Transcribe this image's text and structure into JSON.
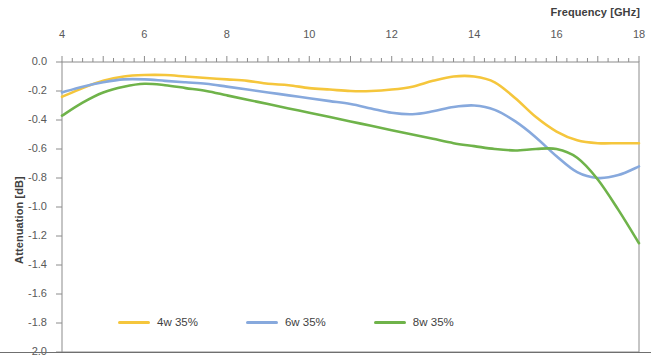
{
  "axes": {
    "x_title": "Frequency [GHz]",
    "y_title": "Attenuation [dB]",
    "x_ticks": [
      "4",
      "6",
      "8",
      "10",
      "12",
      "14",
      "16",
      "18"
    ],
    "y_ticks": [
      "0.0",
      "-0.2",
      "-0.4",
      "-0.6",
      "-0.8",
      "-1.0",
      "-1.2",
      "-1.4",
      "-1.6",
      "-1.8",
      "-2.0"
    ]
  },
  "legend": {
    "items": [
      {
        "label": "4w 35%",
        "color": "#f5c63c"
      },
      {
        "label": "6w 35%",
        "color": "#87a9dd"
      },
      {
        "label": "8w 35%",
        "color": "#6fb34a"
      }
    ]
  },
  "chart_data": {
    "type": "line",
    "title": "",
    "xlabel": "Frequency [GHz]",
    "ylabel": "Attenuation [dB]",
    "xlim": [
      4,
      18
    ],
    "ylim": [
      -2.0,
      0.0
    ],
    "x_axis_position": "top",
    "grid": false,
    "legend_position": "bottom",
    "x": [
      4,
      4.5,
      5,
      5.5,
      6,
      6.5,
      7,
      7.5,
      8,
      8.5,
      9,
      9.5,
      10,
      10.5,
      11,
      11.5,
      12,
      12.5,
      13,
      13.5,
      14,
      14.5,
      15,
      15.5,
      16,
      16.5,
      17,
      17.5,
      18
    ],
    "series": [
      {
        "name": "4w 35%",
        "color": "#f5c63c",
        "values": [
          -0.24,
          -0.18,
          -0.13,
          -0.1,
          -0.09,
          -0.09,
          -0.1,
          -0.11,
          -0.12,
          -0.13,
          -0.15,
          -0.16,
          -0.18,
          -0.19,
          -0.2,
          -0.2,
          -0.19,
          -0.17,
          -0.13,
          -0.1,
          -0.1,
          -0.14,
          -0.25,
          -0.38,
          -0.48,
          -0.54,
          -0.56,
          -0.56,
          -0.56
        ]
      },
      {
        "name": "6w 35%",
        "color": "#87a9dd",
        "values": [
          -0.21,
          -0.17,
          -0.14,
          -0.12,
          -0.12,
          -0.13,
          -0.14,
          -0.15,
          -0.17,
          -0.19,
          -0.21,
          -0.23,
          -0.25,
          -0.27,
          -0.29,
          -0.32,
          -0.35,
          -0.36,
          -0.34,
          -0.31,
          -0.3,
          -0.33,
          -0.41,
          -0.52,
          -0.65,
          -0.76,
          -0.8,
          -0.78,
          -0.72
        ]
      },
      {
        "name": "8w 35%",
        "color": "#6fb34a",
        "values": [
          -0.37,
          -0.28,
          -0.21,
          -0.17,
          -0.15,
          -0.16,
          -0.18,
          -0.2,
          -0.23,
          -0.26,
          -0.29,
          -0.32,
          -0.35,
          -0.38,
          -0.41,
          -0.44,
          -0.47,
          -0.5,
          -0.53,
          -0.56,
          -0.58,
          -0.6,
          -0.61,
          -0.6,
          -0.6,
          -0.66,
          -0.81,
          -1.02,
          -1.25
        ]
      }
    ]
  }
}
